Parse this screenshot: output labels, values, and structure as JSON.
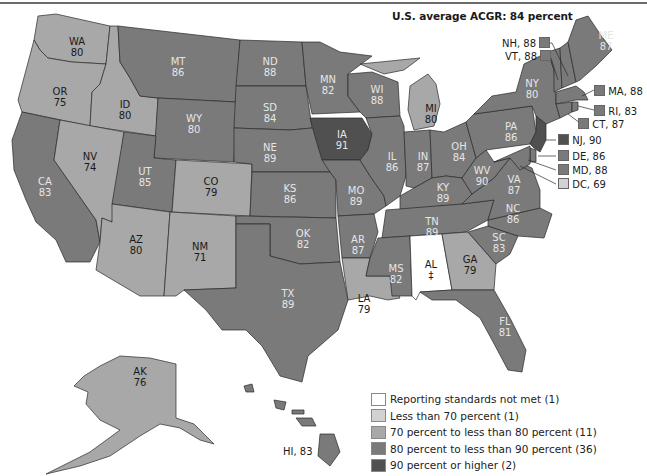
{
  "title": "U.S. average ACGR: 84 percent",
  "colors": {
    "not_met": "#ffffff",
    "lt70": "#d2d2d2",
    "70to80": "#a8a8a8",
    "80to90": "#7a7a7a",
    "gte90": "#505050",
    "border": "#2a2a2a"
  },
  "legend": [
    {
      "label": "Reporting standards not met (1)",
      "color": "#ffffff"
    },
    {
      "label": "Less than 70 percent (1)",
      "color": "#d2d2d2"
    },
    {
      "label": "70 percent to less than 80 percent (11)",
      "color": "#a8a8a8"
    },
    {
      "label": "80 percent to less than 90 percent (36)",
      "color": "#7a7a7a"
    },
    {
      "label": "90 percent or higher (2)",
      "color": "#505050"
    }
  ],
  "states": {
    "WA": {
      "abbr": "WA",
      "value": "80"
    },
    "OR": {
      "abbr": "OR",
      "value": "75"
    },
    "CA": {
      "abbr": "CA",
      "value": "83"
    },
    "ID": {
      "abbr": "ID",
      "value": "80"
    },
    "NV": {
      "abbr": "NV",
      "value": "74"
    },
    "MT": {
      "abbr": "MT",
      "value": "86"
    },
    "WY": {
      "abbr": "WY",
      "value": "80"
    },
    "UT": {
      "abbr": "UT",
      "value": "85"
    },
    "AZ": {
      "abbr": "AZ",
      "value": "80"
    },
    "CO": {
      "abbr": "CO",
      "value": "79"
    },
    "NM": {
      "abbr": "NM",
      "value": "71"
    },
    "ND": {
      "abbr": "ND",
      "value": "88"
    },
    "SD": {
      "abbr": "SD",
      "value": "84"
    },
    "NE": {
      "abbr": "NE",
      "value": "89"
    },
    "KS": {
      "abbr": "KS",
      "value": "86"
    },
    "OK": {
      "abbr": "OK",
      "value": "82"
    },
    "TX": {
      "abbr": "TX",
      "value": "89"
    },
    "MN": {
      "abbr": "MN",
      "value": "82"
    },
    "IA": {
      "abbr": "IA",
      "value": "91"
    },
    "MO": {
      "abbr": "MO",
      "value": "89"
    },
    "AR": {
      "abbr": "AR",
      "value": "87"
    },
    "LA": {
      "abbr": "LA",
      "value": "79"
    },
    "WI": {
      "abbr": "WI",
      "value": "88"
    },
    "IL": {
      "abbr": "IL",
      "value": "86"
    },
    "MI": {
      "abbr": "MI",
      "value": "80"
    },
    "IN": {
      "abbr": "IN",
      "value": "87"
    },
    "OH": {
      "abbr": "OH",
      "value": "84"
    },
    "KY": {
      "abbr": "KY",
      "value": "89"
    },
    "TN": {
      "abbr": "TN",
      "value": "89"
    },
    "MS": {
      "abbr": "MS",
      "value": "82"
    },
    "AL": {
      "abbr": "AL",
      "value": "‡"
    },
    "GA": {
      "abbr": "GA",
      "value": "79"
    },
    "FL": {
      "abbr": "FL",
      "value": "81"
    },
    "SC": {
      "abbr": "SC",
      "value": "83"
    },
    "NC": {
      "abbr": "NC",
      "value": "86"
    },
    "VA": {
      "abbr": "VA",
      "value": "87"
    },
    "WV": {
      "abbr": "WV",
      "value": "90"
    },
    "PA": {
      "abbr": "PA",
      "value": "86"
    },
    "NY": {
      "abbr": "NY",
      "value": "80"
    },
    "ME": {
      "abbr": "ME",
      "value": "87"
    },
    "AK": {
      "abbr": "AK",
      "value": "76"
    }
  },
  "callouts": [
    {
      "label": "NH, 88",
      "color": "#7a7a7a"
    },
    {
      "label": "VT, 88",
      "color": "#7a7a7a"
    },
    {
      "label": "MA, 88",
      "color": "#7a7a7a"
    },
    {
      "label": "RI, 83",
      "color": "#7a7a7a"
    },
    {
      "label": "CT, 87",
      "color": "#7a7a7a"
    },
    {
      "label": "NJ, 90",
      "color": "#505050"
    },
    {
      "label": "DE, 86",
      "color": "#7a7a7a"
    },
    {
      "label": "MD, 88",
      "color": "#7a7a7a"
    },
    {
      "label": "DC, 69",
      "color": "#d2d2d2"
    },
    {
      "label": "HI, 83",
      "color": "#7a7a7a"
    }
  ]
}
